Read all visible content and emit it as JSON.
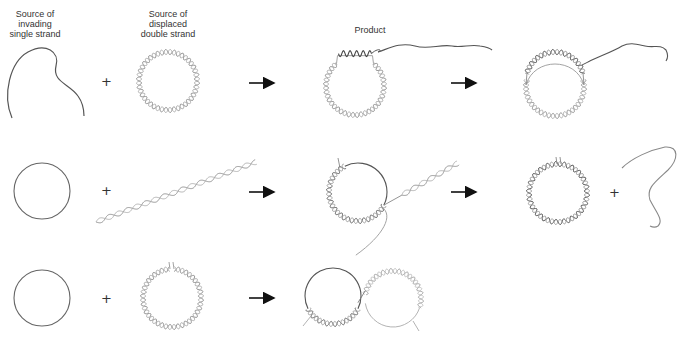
{
  "figure": {
    "type": "strand-exchange-diagram",
    "labels": {
      "invading_source": "Source of\ninvading\nsingle strand",
      "invading_source_lines": [
        "Source of",
        "invading",
        "single strand"
      ],
      "displaced_source_lines": [
        "Source of",
        "displaced",
        "double strand"
      ],
      "product": "Product"
    },
    "operators": {
      "plus": "+",
      "arrow": "→"
    },
    "colors": {
      "single_strand": "#555555",
      "duplex_strand": "#8a8a8a",
      "arrow": "#111111",
      "text": "#333333",
      "background": "#ffffff"
    },
    "rows": [
      {
        "id": "row-1",
        "reactants": [
          "linear single strand",
          "circular double strand"
        ],
        "intermediate": "circular duplex with invaded single strand (D-loop) - Product",
        "result": "circular duplex with displaced strand loop and single strand tail"
      },
      {
        "id": "row-2",
        "reactants": [
          "circular single strand",
          "linear double strand"
        ],
        "intermediate": "circle partially paired with linear duplex",
        "result": [
          "circular double strand (nicked)",
          "linear displaced single strand"
        ]
      },
      {
        "id": "row-3",
        "reactants": [
          "circular single strand",
          "nicked circular double strand"
        ],
        "result": "two linked circles joined by exchanged strand"
      }
    ]
  }
}
